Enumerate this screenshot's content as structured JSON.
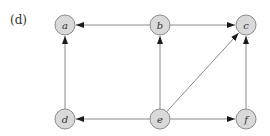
{
  "panel_label": "(d)",
  "colors": {
    "node_fill": "#d9d9d9",
    "node_stroke": "#8c8c8c",
    "edge": "#8a8a8a",
    "arrowhead": "#1a1a1a",
    "label": "#333333"
  },
  "graph": {
    "directed": true,
    "node_radius": 10,
    "nodes": [
      {
        "id": "a",
        "label": "a",
        "x": 65,
        "y": 25
      },
      {
        "id": "b",
        "label": "b",
        "x": 160,
        "y": 25
      },
      {
        "id": "c",
        "label": "c",
        "x": 246,
        "y": 25
      },
      {
        "id": "d",
        "label": "d",
        "x": 65,
        "y": 119
      },
      {
        "id": "e",
        "label": "e",
        "x": 160,
        "y": 119
      },
      {
        "id": "f",
        "label": "f",
        "x": 246,
        "y": 119
      }
    ],
    "edges": [
      {
        "from": "b",
        "to": "a"
      },
      {
        "from": "b",
        "to": "c"
      },
      {
        "from": "d",
        "to": "a"
      },
      {
        "from": "e",
        "to": "b"
      },
      {
        "from": "e",
        "to": "c"
      },
      {
        "from": "f",
        "to": "c"
      },
      {
        "from": "e",
        "to": "d"
      },
      {
        "from": "e",
        "to": "f"
      }
    ]
  }
}
